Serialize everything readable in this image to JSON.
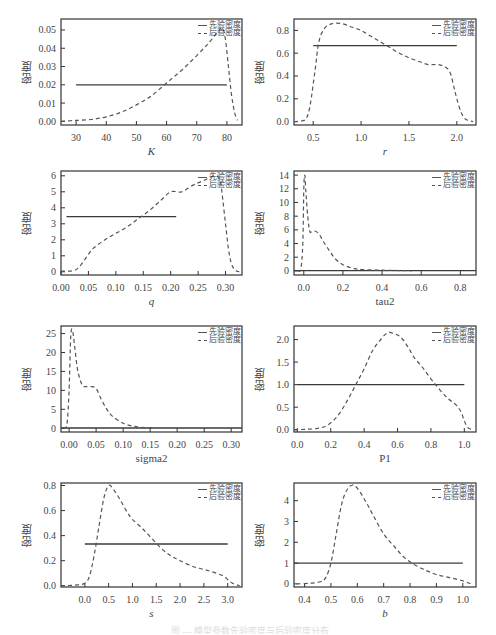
{
  "figure": {
    "legend": {
      "prior": "先验密度",
      "posterior": "后验密度"
    },
    "ylabel": "密度",
    "caption": "图 — 模型参数先验密度与后验密度分布"
  },
  "colors": {
    "axis": "#333333",
    "prior": "#3a3a3a",
    "posterior": "#555555",
    "background": "#ffffff"
  },
  "chart_data": [
    {
      "type": "line",
      "id": "K",
      "title": "",
      "xlabel": "K",
      "ylabel": "密度",
      "xlim": [
        25,
        85
      ],
      "ylim": [
        -0.002,
        0.056
      ],
      "xticks": [
        30,
        40,
        50,
        60,
        70,
        80
      ],
      "xtick_labels": [
        "30",
        "40",
        "50",
        "60",
        "70",
        "80"
      ],
      "yticks": [
        0,
        0.01,
        0.02,
        0.03,
        0.04,
        0.05
      ],
      "ytick_labels": [
        "0.00",
        "0.01",
        "0.02",
        "0.03",
        "0.04",
        "0.05"
      ],
      "legend": [
        "先验密度",
        "后验密度"
      ],
      "legend_position": "top-right",
      "grid": false,
      "series": [
        {
          "name": "先验密度",
          "style": "solid",
          "x": [
            30,
            80
          ],
          "y": [
            0.02,
            0.02
          ]
        },
        {
          "name": "后验密度",
          "style": "dashed",
          "x": [
            25,
            30,
            35,
            40,
            45,
            50,
            55,
            60,
            65,
            70,
            74,
            77,
            78.5,
            79.5,
            80.5,
            81.5,
            82.5,
            83.5
          ],
          "y": [
            0,
            0.0005,
            0.001,
            0.0025,
            0.005,
            0.009,
            0.014,
            0.021,
            0.028,
            0.036,
            0.043,
            0.049,
            0.051,
            0.045,
            0.03,
            0.015,
            0.005,
            0.0005
          ]
        }
      ]
    },
    {
      "type": "line",
      "id": "r",
      "title": "",
      "xlabel": "r",
      "ylabel": "密度",
      "xlim": [
        0.3,
        2.2
      ],
      "ylim": [
        -0.03,
        0.9
      ],
      "xticks": [
        0.5,
        1.0,
        1.5,
        2.0
      ],
      "xtick_labels": [
        "0.5",
        "1.0",
        "1.5",
        "2.0"
      ],
      "yticks": [
        0,
        0.2,
        0.4,
        0.6,
        0.8
      ],
      "ytick_labels": [
        "0.0",
        "0.2",
        "0.4",
        "0.6",
        "0.8"
      ],
      "legend": [
        "先验密度",
        "后验密度"
      ],
      "legend_position": "top-right",
      "grid": false,
      "series": [
        {
          "name": "先验密度",
          "style": "solid",
          "x": [
            0.5,
            2.0
          ],
          "y": [
            0.667,
            0.667
          ]
        },
        {
          "name": "后验密度",
          "style": "dashed",
          "x": [
            0.3,
            0.38,
            0.43,
            0.47,
            0.52,
            0.56,
            0.62,
            0.7,
            0.8,
            0.9,
            1.0,
            1.1,
            1.2,
            1.3,
            1.4,
            1.5,
            1.6,
            1.7,
            1.8,
            1.88,
            1.93,
            1.97,
            2.0,
            2.04,
            2.08,
            2.12,
            2.17
          ],
          "y": [
            0,
            0.005,
            0.03,
            0.15,
            0.45,
            0.7,
            0.82,
            0.86,
            0.86,
            0.83,
            0.8,
            0.75,
            0.7,
            0.65,
            0.6,
            0.56,
            0.53,
            0.5,
            0.5,
            0.48,
            0.43,
            0.3,
            0.2,
            0.09,
            0.03,
            0.01,
            0
          ]
        }
      ]
    },
    {
      "type": "line",
      "id": "q",
      "title": "",
      "xlabel": "q",
      "ylabel": "密度",
      "xlim": [
        0.0,
        0.33
      ],
      "ylim": [
        -0.2,
        6.3
      ],
      "xticks": [
        0.0,
        0.05,
        0.1,
        0.15,
        0.2,
        0.25,
        0.3
      ],
      "xtick_labels": [
        "0.00",
        "0.05",
        "0.10",
        "0.15",
        "0.20",
        "0.25",
        "0.30"
      ],
      "yticks": [
        0,
        1,
        2,
        3,
        4,
        5,
        6
      ],
      "ytick_labels": [
        "0",
        "1",
        "2",
        "3",
        "4",
        "5",
        "6"
      ],
      "legend": [
        "先验密度",
        "后验密度"
      ],
      "legend_position": "top-right",
      "grid": false,
      "series": [
        {
          "name": "先验密度",
          "style": "solid",
          "x": [
            0.01,
            0.21
          ],
          "y": [
            3.45,
            3.45
          ]
        },
        {
          "name": "后验密度",
          "style": "dashed",
          "x": [
            0.0,
            0.02,
            0.03,
            0.04,
            0.05,
            0.06,
            0.08,
            0.1,
            0.12,
            0.14,
            0.16,
            0.18,
            0.2,
            0.22,
            0.24,
            0.26,
            0.28,
            0.29,
            0.295,
            0.3,
            0.305,
            0.31,
            0.315,
            0.32,
            0.325
          ],
          "y": [
            0.05,
            0.05,
            0.2,
            0.6,
            1.1,
            1.5,
            2.0,
            2.4,
            2.8,
            3.3,
            3.8,
            4.4,
            5.0,
            5.0,
            5.4,
            5.7,
            6.0,
            5.7,
            4.5,
            3.0,
            1.5,
            0.6,
            0.2,
            0.05,
            0
          ]
        }
      ]
    },
    {
      "type": "line",
      "id": "tau2",
      "title": "",
      "xlabel": "tau2",
      "ylabel": "密度",
      "xlim": [
        -0.05,
        0.88
      ],
      "ylim": [
        -0.6,
        14.6
      ],
      "xticks": [
        0.0,
        0.2,
        0.4,
        0.6,
        0.8
      ],
      "xtick_labels": [
        "0.0",
        "0.2",
        "0.4",
        "0.6",
        "0.8"
      ],
      "yticks": [
        0,
        2,
        4,
        6,
        8,
        10,
        12,
        14
      ],
      "ytick_labels": [
        "0",
        "2",
        "4",
        "6",
        "8",
        "10",
        "12",
        "14"
      ],
      "legend": [
        "先验密度",
        "后验密度"
      ],
      "legend_position": "top-right",
      "grid": false,
      "series": [
        {
          "name": "先验密度",
          "style": "solid",
          "x": [
            -0.05,
            0.88
          ],
          "y": [
            0.05,
            0.05
          ]
        },
        {
          "name": "后验密度",
          "style": "dashed",
          "x": [
            -0.03,
            -0.015,
            -0.005,
            0.0,
            0.005,
            0.01,
            0.02,
            0.03,
            0.04,
            0.06,
            0.08,
            0.1,
            0.13,
            0.16,
            0.2,
            0.25,
            0.3,
            0.4,
            0.5,
            0.55
          ],
          "y": [
            0,
            0.3,
            4,
            12,
            14,
            12,
            8,
            5.8,
            5.7,
            5.8,
            5.3,
            4.3,
            3.0,
            1.8,
            0.9,
            0.4,
            0.2,
            0.1,
            0.05,
            0
          ]
        }
      ]
    },
    {
      "type": "line",
      "id": "sigma2",
      "title": "",
      "xlabel": "sigma2",
      "ylabel": "密度",
      "xlim": [
        -0.015,
        0.32
      ],
      "ylim": [
        -1,
        27
      ],
      "xticks": [
        0.0,
        0.05,
        0.1,
        0.15,
        0.2,
        0.25,
        0.3
      ],
      "xtick_labels": [
        "0.00",
        "0.05",
        "0.10",
        "0.15",
        "0.20",
        "0.25",
        "0.30"
      ],
      "yticks": [
        0,
        5,
        10,
        15,
        20,
        25
      ],
      "ytick_labels": [
        "0",
        "5",
        "10",
        "15",
        "20",
        "25"
      ],
      "legend": [
        "先验密度",
        "后验密度"
      ],
      "legend_position": "top-right",
      "grid": false,
      "series": [
        {
          "name": "先验密度",
          "style": "solid",
          "x": [
            -0.015,
            0.32
          ],
          "y": [
            0.05,
            0.05
          ]
        },
        {
          "name": "后验密度",
          "style": "dashed",
          "x": [
            -0.01,
            -0.004,
            0.0,
            0.003,
            0.006,
            0.01,
            0.015,
            0.02,
            0.025,
            0.03,
            0.04,
            0.05,
            0.06,
            0.07,
            0.08,
            0.1,
            0.12,
            0.14,
            0.16
          ],
          "y": [
            0,
            1,
            10,
            24,
            26,
            22,
            16,
            13,
            11.2,
            11,
            11,
            10.5,
            7.5,
            5,
            3.2,
            1.3,
            0.5,
            0.15,
            0
          ]
        }
      ]
    },
    {
      "type": "line",
      "id": "P1",
      "title": "",
      "xlabel": "P1",
      "ylabel": "密度",
      "xlim": [
        -0.02,
        1.07
      ],
      "ylim": [
        -0.05,
        2.3
      ],
      "xticks": [
        0.0,
        0.2,
        0.4,
        0.6,
        0.8,
        1.0
      ],
      "xtick_labels": [
        "0.0",
        "0.2",
        "0.4",
        "0.6",
        "0.8",
        "1.0"
      ],
      "yticks": [
        0,
        0.5,
        1.0,
        1.5,
        2.0
      ],
      "ytick_labels": [
        "0.0",
        "0.5",
        "1.0",
        "1.5",
        "2.0"
      ],
      "legend": [
        "先验密度",
        "后验密度"
      ],
      "legend_position": "top-right",
      "grid": false,
      "series": [
        {
          "name": "先验密度",
          "style": "solid",
          "x": [
            0.0,
            1.0
          ],
          "y": [
            1.0,
            1.0
          ]
        },
        {
          "name": "后验密度",
          "style": "dashed",
          "x": [
            -0.02,
            0.05,
            0.12,
            0.18,
            0.24,
            0.3,
            0.35,
            0.4,
            0.45,
            0.5,
            0.54,
            0.58,
            0.62,
            0.66,
            0.7,
            0.75,
            0.8,
            0.85,
            0.9,
            0.95,
            0.98,
            1.0,
            1.02,
            1.05
          ],
          "y": [
            0,
            0.01,
            0.03,
            0.1,
            0.3,
            0.65,
            1.0,
            1.35,
            1.75,
            2.0,
            2.15,
            2.13,
            2.05,
            1.85,
            1.6,
            1.38,
            1.13,
            0.9,
            0.7,
            0.55,
            0.4,
            0.2,
            0.05,
            0
          ]
        }
      ]
    },
    {
      "type": "line",
      "id": "s",
      "title": "",
      "xlabel": "s",
      "ylabel": "密度",
      "xlim": [
        -0.5,
        3.3
      ],
      "ylim": [
        -0.01,
        0.82
      ],
      "xticks": [
        0.0,
        0.5,
        1.0,
        1.5,
        2.0,
        2.5,
        3.0
      ],
      "xtick_labels": [
        "0.0",
        "0.5",
        "1.0",
        "1.5",
        "2.0",
        "2.5",
        "3.0"
      ],
      "yticks": [
        0,
        0.2,
        0.4,
        0.6,
        0.8
      ],
      "ytick_labels": [
        "0.0",
        "0.2",
        "0.4",
        "0.6",
        "0.8"
      ],
      "legend": [
        "先验密度",
        "后验密度"
      ],
      "legend_position": "top-right",
      "grid": false,
      "series": [
        {
          "name": "先验密度",
          "style": "solid",
          "x": [
            0.0,
            3.0
          ],
          "y": [
            0.333,
            0.333
          ]
        },
        {
          "name": "后验密度",
          "style": "dashed",
          "x": [
            -0.5,
            -0.2,
            0.0,
            0.1,
            0.2,
            0.3,
            0.4,
            0.5,
            0.6,
            0.75,
            0.9,
            1.0,
            1.2,
            1.4,
            1.6,
            1.8,
            2.0,
            2.3,
            2.6,
            2.9,
            3.0,
            3.1,
            3.25
          ],
          "y": [
            0,
            0.005,
            0.02,
            0.08,
            0.25,
            0.48,
            0.7,
            0.8,
            0.77,
            0.68,
            0.58,
            0.53,
            0.46,
            0.38,
            0.3,
            0.24,
            0.2,
            0.15,
            0.12,
            0.08,
            0.05,
            0.02,
            0
          ]
        }
      ]
    },
    {
      "type": "line",
      "id": "b",
      "title": "",
      "xlabel": "b",
      "ylabel": "密度",
      "xlim": [
        0.36,
        1.05
      ],
      "ylim": [
        -0.15,
        4.85
      ],
      "xticks": [
        0.4,
        0.5,
        0.6,
        0.7,
        0.8,
        0.9,
        1.0
      ],
      "xtick_labels": [
        "0.4",
        "0.5",
        "0.6",
        "0.7",
        "0.8",
        "0.9",
        "1.0"
      ],
      "yticks": [
        0,
        1,
        2,
        3,
        4
      ],
      "ytick_labels": [
        "0",
        "1",
        "2",
        "3",
        "4"
      ],
      "legend": [
        "先验密度",
        "后验密度"
      ],
      "legend_position": "top-right",
      "grid": false,
      "series": [
        {
          "name": "先验密度",
          "style": "solid",
          "x": [
            0.36,
            1.0
          ],
          "y": [
            1.0,
            1.0
          ]
        },
        {
          "name": "后验密度",
          "style": "dashed",
          "x": [
            0.37,
            0.42,
            0.46,
            0.48,
            0.5,
            0.52,
            0.54,
            0.56,
            0.58,
            0.6,
            0.63,
            0.66,
            0.7,
            0.74,
            0.78,
            0.82,
            0.86,
            0.9,
            0.95,
            1.0,
            1.03
          ],
          "y": [
            0,
            0.03,
            0.1,
            0.3,
            1.0,
            2.4,
            3.8,
            4.5,
            4.75,
            4.6,
            4.0,
            3.3,
            2.4,
            1.8,
            1.25,
            0.9,
            0.65,
            0.45,
            0.3,
            0.15,
            0
          ]
        }
      ]
    }
  ]
}
